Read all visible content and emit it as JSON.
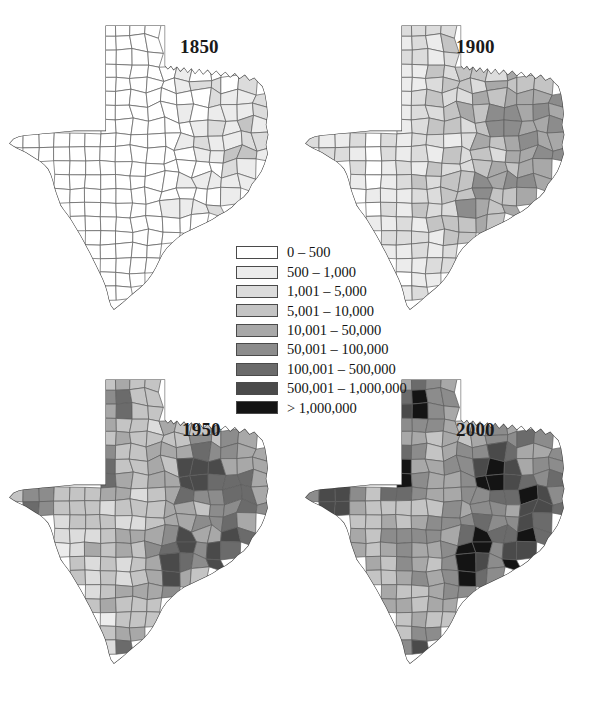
{
  "figure": {
    "background_color": "#ffffff"
  },
  "legend": {
    "name": "population-legend",
    "classes": [
      {
        "label": "0 – 500",
        "color": "#ffffff",
        "min": 0,
        "max": 500
      },
      {
        "label": "500 – 1,000",
        "color": "#ececec",
        "min": 500,
        "max": 1000
      },
      {
        "label": "1,001 – 5,000",
        "color": "#dcdcdc",
        "min": 1001,
        "max": 5000
      },
      {
        "label": "5,001 – 10,000",
        "color": "#c4c4c4",
        "min": 5001,
        "max": 10000
      },
      {
        "label": "10,001 – 50,000",
        "color": "#a8a8a8",
        "min": 10001,
        "max": 50000
      },
      {
        "label": "50,001 – 100,000",
        "color": "#8c8c8c",
        "min": 50001,
        "max": 100000
      },
      {
        "label": "100,001 – 500,000",
        "color": "#6b6b6b",
        "min": 100001,
        "max": 500000
      },
      {
        "label": "500,001 – 1,000,000",
        "color": "#4a4a4a",
        "min": 500001,
        "max": 1000000
      },
      {
        "label": "> 1,000,000",
        "color": "#141414",
        "min": 1000001,
        "max": null
      }
    ]
  },
  "panels": [
    {
      "id": "1850",
      "year": "1850",
      "name": "map-1850"
    },
    {
      "id": "1900",
      "year": "1900",
      "name": "map-1900"
    },
    {
      "id": "1950",
      "year": "1950",
      "name": "map-1950"
    },
    {
      "id": "2000",
      "year": "2000",
      "name": "map-2000"
    }
  ],
  "chart_data": {
    "type": "map",
    "subtype": "choropleth",
    "region": "Texas",
    "unit": "county",
    "grid": "2x2 small multiples",
    "legend_position": "center",
    "panels": [
      "1850",
      "1900",
      "1950",
      "2000"
    ],
    "class_breaks": [
      0,
      500,
      1000,
      5000,
      10000,
      50000,
      100000,
      500000,
      1000000
    ],
    "class_labels": [
      "0 – 500",
      "500 – 1,000",
      "1,001 – 5,000",
      "5,001 – 10,000",
      "10,001 – 50,000",
      "50,001 – 100,000",
      "100,001 – 500,000",
      "500,001 – 1,000,000",
      "> 1,000,000"
    ],
    "class_colors": [
      "#ffffff",
      "#ececec",
      "#dcdcdc",
      "#c4c4c4",
      "#a8a8a8",
      "#8c8c8c",
      "#6b6b6b",
      "#4a4a4a",
      "#141414"
    ],
    "observations": [
      {
        "year": "1850",
        "summary": "Population confined to east and south-central Texas; the panhandle, west Texas and far south are nearly all in the 0-500 class. A handful of counties reach 5,001-10,000.",
        "max_class": "10,001 – 50,000",
        "shaded_share": 0.28
      },
      {
        "year": "1900",
        "summary": "Broad band of 5,001-50,000 counties across east, north-central and central Texas; west Texas and panhandle still sparsely populated.",
        "max_class": "50,001 – 100,000",
        "shaded_share": 0.62
      },
      {
        "year": "1950",
        "summary": "Nearly every county shaded; panhandle and west Texas reach 1,001-10,000. Dark urban counties appear at Dallas, Tarrant, Harris and Bexar.",
        "max_class": "500,001 – 1,000,000",
        "shaded_share": 0.95
      },
      {
        "year": "2000",
        "summary": "Heavy urban concentration: Harris, Dallas, Tarrant and Bexar exceed 1,000,000; rural west Texas counties remain in the lower classes.",
        "max_class": "> 1,000,000",
        "shaded_share": 0.99
      }
    ]
  }
}
